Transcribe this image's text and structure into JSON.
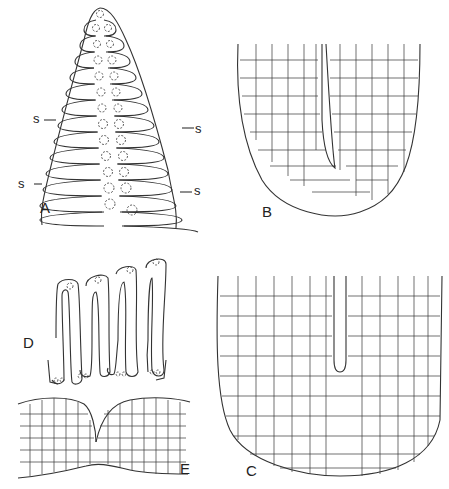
{
  "figure": {
    "panels": [
      {
        "id": "A",
        "label": "A",
        "description": "Conical apex with paired rows of elongated cells, dotted nuclei near midline"
      },
      {
        "id": "B",
        "label": "B",
        "description": "U-shaped cellular tissue section with central cleft"
      },
      {
        "id": "C",
        "label": "C",
        "description": "Larger U-shaped cellular tissue section with central cleft"
      },
      {
        "id": "D",
        "label": "D",
        "description": "Four isolated elongated hairpin cells with apical nuclei"
      },
      {
        "id": "E",
        "label": "E",
        "description": "Cellular tissue with two rounded lobes meeting at a notch"
      }
    ],
    "annotations": {
      "s_left_upper": "s",
      "s_left_lower": "s",
      "s_right_upper": "s",
      "s_right_lower": "s"
    },
    "colors": {
      "line": "#333333",
      "background": "#ffffff"
    }
  }
}
